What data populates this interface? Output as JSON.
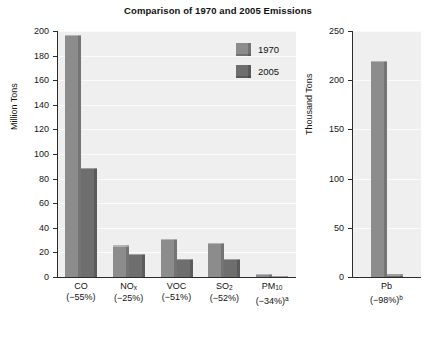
{
  "chart_data": {
    "type": "bar",
    "title": "Comparison of 1970 and 2005 Emissions",
    "panels": [
      {
        "id": "main",
        "ylabel": "Million Tons",
        "ylim": [
          0,
          200
        ],
        "yticks": [
          0,
          20,
          40,
          60,
          80,
          100,
          120,
          140,
          160,
          180,
          200
        ],
        "ytick_labels": [
          "0",
          "20",
          "40",
          "60",
          "80",
          "100",
          "120",
          "140",
          "160",
          "180",
          "200"
        ],
        "grid": true,
        "categories": [
          {
            "name": "CO",
            "line1": "CO",
            "line2": "(−55%)",
            "sup": ""
          },
          {
            "name": "NOx",
            "line1_html": "NO<sub>x</sub>",
            "line2": "(−25%)",
            "sup": ""
          },
          {
            "name": "VOC",
            "line1": "VOC",
            "line2": "(−51%)",
            "sup": ""
          },
          {
            "name": "SO2",
            "line1_html": "SO<sub>2</sub>",
            "line2": "(−52%)",
            "sup": ""
          },
          {
            "name": "PM10",
            "line1_html": "PM<sub>10</sub>",
            "line2": "(−34%)",
            "sup": "a"
          }
        ],
        "series": [
          {
            "name": "1970",
            "color": "#8c8c8c",
            "values": [
              197,
              26,
              31,
              28,
              2.5
            ]
          },
          {
            "name": "2005",
            "color": "#6e6e6e",
            "values": [
              89,
              19,
              15,
              15,
              1.2
            ]
          }
        ]
      },
      {
        "id": "lead",
        "ylabel": "Thousand Tons",
        "ylim": [
          0,
          250
        ],
        "yticks": [
          0,
          50,
          100,
          150,
          200,
          250
        ],
        "ytick_labels": [
          "0",
          "50",
          "100",
          "150",
          "200",
          "250"
        ],
        "grid": true,
        "categories": [
          {
            "name": "Pb",
            "line1": "Pb",
            "line2": "(−98%)",
            "sup": "b"
          }
        ],
        "series": [
          {
            "name": "1970",
            "color": "#8c8c8c",
            "values": [
              220
            ]
          },
          {
            "name": "2005",
            "color": "#6e6e6e",
            "values": [
              3
            ]
          }
        ]
      }
    ],
    "legend": {
      "position": "inside-top-right",
      "entries": [
        {
          "label": "1970",
          "color": "#8c8c8c"
        },
        {
          "label": "2005",
          "color": "#6e6e6e"
        }
      ]
    }
  },
  "colors": {
    "series_1970": "#8c8c8c",
    "series_2005": "#6e6e6e",
    "plot_background": "#efefef",
    "axis": "#2b2b2b",
    "page_background": "#ffffff"
  }
}
